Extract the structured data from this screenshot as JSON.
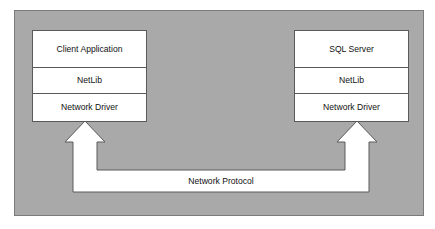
{
  "diagram": {
    "background_color": "#ffffff",
    "panel": {
      "fill_color": "#a9a9a9",
      "border_color": "#7b7b7b"
    },
    "box_fill_color": "#ffffff",
    "box_border_color": "#5a5a5a",
    "connector_fill_color": "#ffffff",
    "connector_border_color": "#5a5a5a"
  },
  "client_stack": {
    "name": "client-stack",
    "layers": [
      {
        "id": "client-application",
        "label": "Client Application"
      },
      {
        "id": "netlib",
        "label": "NetLib"
      },
      {
        "id": "network-driver",
        "label": "Network Driver"
      }
    ]
  },
  "server_stack": {
    "name": "server-stack",
    "layers": [
      {
        "id": "sql-server",
        "label": "SQL Server"
      },
      {
        "id": "netlib",
        "label": "NetLib"
      },
      {
        "id": "network-driver",
        "label": "Network Driver"
      }
    ]
  },
  "connector": {
    "id": "network-protocol-connector",
    "label": "Network Protocol",
    "shape": "double-headed-bracket-arrow",
    "direction": "bidirectional-upward"
  }
}
